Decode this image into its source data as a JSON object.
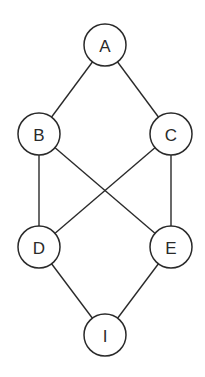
{
  "diagram": {
    "type": "lattice-graph",
    "nodes": [
      {
        "id": "A",
        "label": "A",
        "x": 105,
        "y": 45
      },
      {
        "id": "B",
        "label": "B",
        "x": 39,
        "y": 134
      },
      {
        "id": "C",
        "label": "C",
        "x": 171,
        "y": 134
      },
      {
        "id": "D",
        "label": "D",
        "x": 39,
        "y": 247
      },
      {
        "id": "E",
        "label": "E",
        "x": 171,
        "y": 247
      },
      {
        "id": "I",
        "label": "I",
        "x": 105,
        "y": 335
      }
    ],
    "edges": [
      [
        "A",
        "B"
      ],
      [
        "A",
        "C"
      ],
      [
        "B",
        "D"
      ],
      [
        "B",
        "E"
      ],
      [
        "C",
        "D"
      ],
      [
        "C",
        "E"
      ],
      [
        "D",
        "I"
      ],
      [
        "E",
        "I"
      ]
    ],
    "node_radius": 21,
    "stroke_color": "#2a2a2a",
    "background": "#ffffff"
  }
}
